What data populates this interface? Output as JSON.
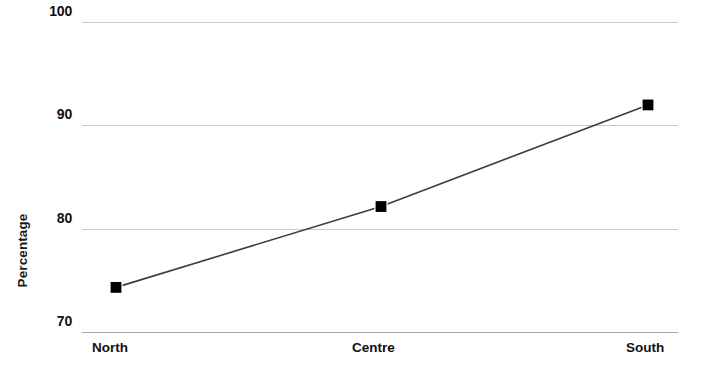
{
  "chart_data": {
    "type": "line",
    "title": "",
    "subtitle": "",
    "xlabel": "",
    "ylabel": "Percentage",
    "categories": [
      "North",
      "Centre",
      "South"
    ],
    "values": [
      74.4,
      82.2,
      92.0
    ],
    "series": [
      {
        "name": "Percentage",
        "values": [
          74.4,
          82.2,
          92.0
        ],
        "marker": "filled-square",
        "marker_color": "#000000",
        "line_color": "#3c3c3c"
      }
    ],
    "ylim": [
      70,
      100
    ],
    "yticks": [
      70,
      80,
      90,
      100
    ],
    "ytick_labels": [
      "70",
      "80",
      "90",
      "100"
    ],
    "xtick_labels": [
      "North",
      "Centre",
      "South"
    ],
    "grid": true,
    "grid_axis": "y",
    "grid_color": "#c9c9c9",
    "legend": false,
    "legend_position": "none",
    "annotations": [],
    "background_color": "#ffffff"
  },
  "axes": {
    "y_title": "Percentage",
    "y_ticks": [
      {
        "label": "100",
        "value": 100
      },
      {
        "label": "90",
        "value": 90
      },
      {
        "label": "80",
        "value": 80
      },
      {
        "label": "70",
        "value": 70
      }
    ],
    "x_ticks": [
      {
        "label": "North"
      },
      {
        "label": "Centre"
      },
      {
        "label": "South"
      }
    ]
  }
}
